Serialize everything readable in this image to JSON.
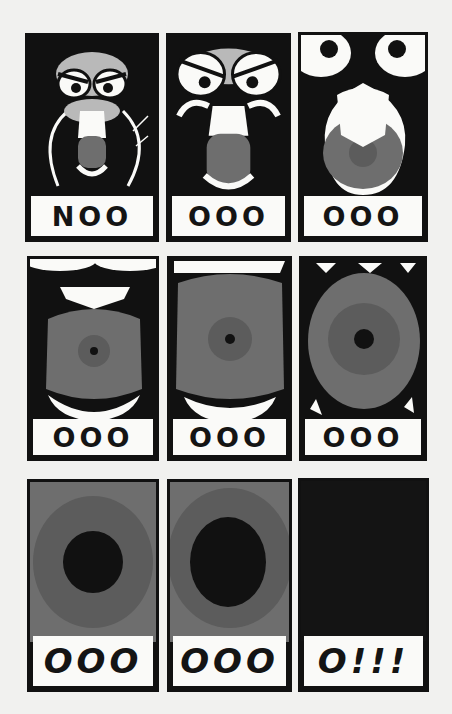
{
  "comic": {
    "description": "Nine-panel comic of an owl-like face screaming, zooming into its mouth until the final panel is black",
    "colors": {
      "ink": "#111111",
      "paper": "#f1f1ef",
      "white": "#fafaf8",
      "light_gray": "#b9b9b9",
      "mouth_gray": "#6e6e6e",
      "mid_gray": "#5c5c5c",
      "throat": "#141414"
    },
    "panels": [
      {
        "caption": "NOO",
        "scene": "owl-face-far"
      },
      {
        "caption": "OOO",
        "scene": "owl-face-closer"
      },
      {
        "caption": "OOO",
        "scene": "owl-face-close"
      },
      {
        "caption": "OOO",
        "scene": "mouth-open-small-throat"
      },
      {
        "caption": "OOO",
        "scene": "mouth-open-medium-throat"
      },
      {
        "caption": "OOO",
        "scene": "mouth-open-large-throat"
      },
      {
        "caption": "OOO",
        "scene": "throat-closeup"
      },
      {
        "caption": "OOO",
        "scene": "throat-closer"
      },
      {
        "caption": "O!!!",
        "scene": "all-black"
      }
    ]
  }
}
